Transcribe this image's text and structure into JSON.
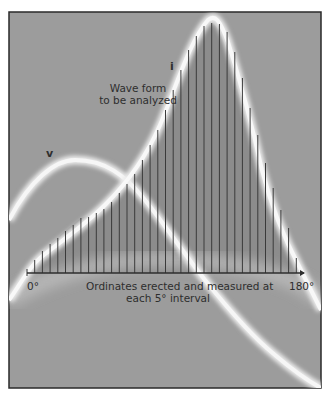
{
  "chart_data": {
    "type": "line",
    "title": "Wave form to be analyzed",
    "xlabel": "Ordinates erected and measured at each 5° interval",
    "ylabel": "",
    "xlim": [
      0,
      180
    ],
    "x_tick_labels": [
      "0°",
      "180°"
    ],
    "grid": false,
    "legend": null,
    "series": [
      {
        "name": "i",
        "description": "wave form to be analyzed (current)"
      },
      {
        "name": "v",
        "description": "voltage wave"
      }
    ],
    "ordinates": {
      "interval_deg": 5,
      "x": [
        5,
        10,
        15,
        20,
        25,
        30,
        35,
        40,
        45,
        50,
        55,
        60,
        65,
        70,
        75,
        80,
        85,
        90,
        95,
        100,
        105,
        110,
        115,
        120,
        125,
        130,
        135,
        140,
        145,
        150,
        155,
        160,
        165,
        170,
        175
      ],
      "relative_height": [
        13,
        22,
        29,
        35,
        42,
        48,
        55,
        56,
        60,
        64,
        71,
        80,
        89,
        99,
        113,
        128,
        143,
        163,
        183,
        203,
        223,
        237,
        247,
        250,
        249,
        241,
        221,
        195,
        165,
        138,
        110,
        85,
        63,
        45,
        15
      ]
    },
    "annotations": [
      "Wave form to be analyzed",
      "i",
      "v",
      "0°",
      "180°",
      "Ordinates erected and measured at each 5° interval"
    ]
  },
  "labels": {
    "title_line1": "Wave form",
    "title_line2": "to be analyzed",
    "i": "i",
    "v": "v",
    "x_start": "0°",
    "x_end": "180°",
    "caption_line1": "Ordinates erected and measured at",
    "caption_line2": "each 5° interval"
  },
  "colors": {
    "background": "#9a9a9a",
    "trace_glow": "#f2f2f2",
    "ordinate": "#3a3a3a",
    "frame": "#2a2a2a",
    "text": "#2e2e2e"
  }
}
